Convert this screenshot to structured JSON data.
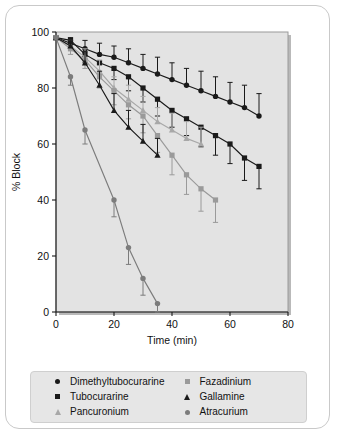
{
  "figure": {
    "background": "#ffffff",
    "card_border": "#c9c9c9",
    "plot_background": "#e3e3e3"
  },
  "chart_data": {
    "type": "line",
    "title": "",
    "xlabel": "Time (min)",
    "ylabel": "% Block",
    "xlim": [
      0,
      80
    ],
    "ylim": [
      0,
      100
    ],
    "xticks": [
      0,
      20,
      40,
      60,
      80
    ],
    "yticks": [
      0,
      20,
      40,
      60,
      80,
      100
    ],
    "grid": false,
    "legend_position": "below-plot",
    "error_bars": "vertical, one-sided / symmetric SEM whiskers",
    "series": [
      {
        "name": "Dimethyltubocurarine",
        "marker": "circle",
        "color": "#1a1a1a",
        "x": [
          0,
          5,
          10,
          15,
          20,
          25,
          30,
          35,
          40,
          45,
          50,
          55,
          60,
          65,
          70
        ],
        "y": [
          98,
          96,
          94,
          92,
          91,
          89,
          87,
          85,
          83,
          81,
          79,
          77,
          75,
          73,
          70
        ],
        "err": [
          1,
          2,
          3,
          4,
          4,
          5,
          5,
          6,
          6,
          6,
          7,
          7,
          7,
          8,
          8
        ]
      },
      {
        "name": "Tubocurarine",
        "marker": "square",
        "color": "#1a1a1a",
        "x": [
          0,
          5,
          10,
          15,
          20,
          25,
          30,
          35,
          40,
          45,
          50,
          55,
          60,
          65,
          70
        ],
        "y": [
          98,
          97,
          92,
          89,
          87,
          84,
          80,
          76,
          72,
          69,
          66,
          63,
          60,
          55,
          52
        ],
        "err": [
          1,
          2,
          3,
          4,
          4,
          5,
          5,
          6,
          6,
          6,
          7,
          7,
          7,
          8,
          8
        ]
      },
      {
        "name": "Pancuronium",
        "marker": "triangle",
        "color": "#a8a8a8",
        "x": [
          0,
          5,
          10,
          15,
          20,
          25,
          30,
          35,
          40,
          45,
          50
        ],
        "y": [
          98,
          95,
          91,
          86,
          80,
          76,
          72,
          68,
          65,
          62,
          60
        ],
        "err": [
          1,
          2,
          3,
          4,
          4,
          5,
          5,
          5,
          6,
          6,
          6
        ]
      },
      {
        "name": "Fazadinium",
        "marker": "square",
        "color": "#9a9a9a",
        "x": [
          0,
          5,
          10,
          15,
          20,
          25,
          30,
          35,
          40,
          45,
          50,
          55
        ],
        "y": [
          98,
          94,
          90,
          84,
          79,
          74,
          70,
          63,
          56,
          49,
          44,
          40
        ],
        "err": [
          1,
          2,
          3,
          4,
          5,
          5,
          6,
          6,
          7,
          7,
          8,
          8
        ]
      },
      {
        "name": "Gallamine",
        "marker": "triangle",
        "color": "#1a1a1a",
        "x": [
          0,
          5,
          10,
          15,
          20,
          25,
          30,
          35
        ],
        "y": [
          98,
          95,
          89,
          81,
          72,
          66,
          61,
          56
        ],
        "err": [
          1,
          2,
          4,
          5,
          6,
          6,
          6,
          6
        ]
      },
      {
        "name": "Atracurium",
        "marker": "circle",
        "color": "#7c7c7c",
        "x": [
          0,
          5,
          10,
          20,
          25,
          30,
          35
        ],
        "y": [
          98,
          84,
          65,
          40,
          23,
          12,
          3
        ],
        "err": [
          1,
          3,
          5,
          6,
          6,
          6,
          5
        ]
      }
    ]
  },
  "legend": {
    "entries": [
      {
        "label": "Dimethyltubocurarine",
        "marker": "circle",
        "color": "#1a1a1a"
      },
      {
        "label": "Fazadinium",
        "marker": "square",
        "color": "#9a9a9a"
      },
      {
        "label": "Tubocurarine",
        "marker": "square",
        "color": "#1a1a1a"
      },
      {
        "label": "Gallamine",
        "marker": "triangle",
        "color": "#1a1a1a"
      },
      {
        "label": "Pancuronium",
        "marker": "triangle",
        "color": "#a8a8a8"
      },
      {
        "label": "Atracurium",
        "marker": "circle",
        "color": "#7c7c7c"
      }
    ]
  }
}
